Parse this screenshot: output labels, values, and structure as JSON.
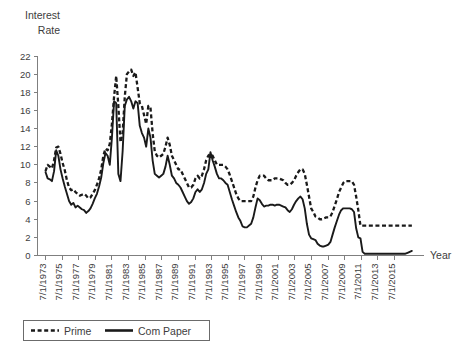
{
  "chart_data": {
    "type": "line",
    "title": "",
    "ylabel": "Interest\nRate",
    "ylabel_lines": [
      "Interest",
      "Rate"
    ],
    "xlabel": "Year",
    "ylim": [
      0,
      22
    ],
    "ytick_step": 2,
    "yticks": [
      0,
      2,
      4,
      6,
      8,
      10,
      12,
      14,
      16,
      18,
      20,
      22
    ],
    "grid": false,
    "legend_position": "bottom-left",
    "xtick_labels": [
      "7/1/1973",
      "7/1/1975",
      "7/1/1977",
      "7/1/1979",
      "7/1/1981",
      "7/1/1983",
      "7/1/1985",
      "7/1/1987",
      "7/1/1989",
      "7/1/1991",
      "7/1/1993",
      "7/1/1995",
      "7/1/1997",
      "7/1/1999",
      "7/1/2001",
      "7/1/2003",
      "7/1/2005",
      "7/1/2007",
      "7/1/2009",
      "7/1/2011",
      "7/1/2013",
      "7/1/2015"
    ],
    "x_start_year": 1973.5,
    "x_end_year": 2016.5,
    "x_step_years": 0.25,
    "series": [
      {
        "name": "Prime",
        "style": "dashed",
        "color": "#1a1a1a",
        "values": [
          9.3,
          10.0,
          9.8,
          9.6,
          10.5,
          11.9,
          12.0,
          11.2,
          10.2,
          9.4,
          8.3,
          7.5,
          7.2,
          7.3,
          7.0,
          6.8,
          6.6,
          6.7,
          6.8,
          6.6,
          6.3,
          6.4,
          6.8,
          7.2,
          7.8,
          8.5,
          9.5,
          11.0,
          11.8,
          11.6,
          12.3,
          14.5,
          17.5,
          19.8,
          16.5,
          12.5,
          13.5,
          17.5,
          20.0,
          20.3,
          20.5,
          19.8,
          20.2,
          18.5,
          16.8,
          16.5,
          15.5,
          14.5,
          16.5,
          16.3,
          13.5,
          11.5,
          11.0,
          10.8,
          11.0,
          11.2,
          12.0,
          13.0,
          12.2,
          11.0,
          10.5,
          10.0,
          9.5,
          9.5,
          9.0,
          8.5,
          8.0,
          7.5,
          7.5,
          7.8,
          8.5,
          8.8,
          8.5,
          8.8,
          9.5,
          10.5,
          11.0,
          11.2,
          11.0,
          10.5,
          10.0,
          10.0,
          10.0,
          10.0,
          9.8,
          9.5,
          8.9,
          8.2,
          7.5,
          6.8,
          6.3,
          6.0,
          6.0,
          6.0,
          6.0,
          6.0,
          6.0,
          6.5,
          7.5,
          8.3,
          8.8,
          8.8,
          8.8,
          8.5,
          8.3,
          8.3,
          8.3,
          8.5,
          8.5,
          8.5,
          8.4,
          8.3,
          8.0,
          7.8,
          7.8,
          8.0,
          8.3,
          8.8,
          9.2,
          9.5,
          9.5,
          9.0,
          7.8,
          6.5,
          5.2,
          4.8,
          4.3,
          4.2,
          4.0,
          4.0,
          4.1,
          4.2,
          4.2,
          4.3,
          4.8,
          5.5,
          6.2,
          7.0,
          7.5,
          8.0,
          8.2,
          8.2,
          8.2,
          8.2,
          7.8,
          6.5,
          5.0,
          3.3,
          3.3,
          3.3,
          3.3,
          3.3,
          3.3,
          3.3,
          3.3,
          3.3,
          3.3,
          3.3,
          3.3,
          3.3,
          3.3,
          3.3,
          3.3,
          3.3,
          3.3,
          3.3,
          3.3,
          3.3,
          3.3,
          3.3,
          3.3,
          3.3
        ]
      },
      {
        "name": "Com Paper",
        "style": "solid",
        "color": "#1a1a1a",
        "values": [
          9.2,
          8.5,
          8.4,
          8.2,
          9.3,
          11.6,
          11.0,
          9.5,
          8.5,
          7.6,
          6.8,
          6.0,
          5.6,
          5.8,
          5.3,
          5.5,
          5.3,
          5.1,
          5.0,
          4.7,
          4.9,
          5.2,
          5.7,
          6.3,
          6.8,
          7.6,
          8.6,
          10.2,
          11.3,
          11.0,
          10.0,
          13.0,
          17.0,
          16.8,
          9.0,
          8.2,
          11.5,
          16.5,
          17.2,
          17.5,
          17.0,
          16.2,
          17.0,
          16.8,
          14.3,
          13.5,
          13.0,
          12.0,
          14.0,
          13.0,
          10.5,
          9.0,
          8.8,
          8.6,
          8.8,
          9.0,
          9.8,
          11.0,
          10.0,
          8.8,
          8.5,
          8.0,
          7.8,
          7.5,
          7.0,
          6.5,
          6.0,
          5.7,
          5.9,
          6.3,
          7.0,
          7.3,
          7.0,
          7.3,
          8.0,
          9.0,
          9.5,
          11.4,
          10.5,
          9.8,
          9.0,
          8.5,
          8.5,
          8.3,
          8.0,
          7.8,
          7.0,
          6.2,
          5.5,
          4.8,
          4.2,
          3.8,
          3.2,
          3.1,
          3.1,
          3.3,
          3.5,
          4.2,
          5.3,
          6.3,
          6.1,
          5.7,
          5.4,
          5.5,
          5.5,
          5.6,
          5.6,
          5.5,
          5.6,
          5.6,
          5.5,
          5.4,
          5.3,
          5.0,
          4.8,
          5.1,
          5.6,
          6.0,
          6.3,
          6.5,
          6.2,
          5.2,
          3.5,
          2.3,
          1.9,
          1.8,
          1.7,
          1.3,
          1.1,
          1.0,
          1.0,
          1.1,
          1.2,
          1.5,
          2.3,
          3.1,
          3.8,
          4.5,
          5.0,
          5.2,
          5.2,
          5.2,
          5.2,
          5.1,
          4.8,
          3.0,
          2.0,
          1.9,
          0.4,
          0.2,
          0.2,
          0.2,
          0.2,
          0.2,
          0.2,
          0.2,
          0.2,
          0.2,
          0.2,
          0.2,
          0.2,
          0.2,
          0.2,
          0.2,
          0.2,
          0.2,
          0.2,
          0.2,
          0.2,
          0.3,
          0.4,
          0.5
        ]
      }
    ]
  },
  "legend": {
    "items": [
      {
        "label": "Prime",
        "style": "dashed"
      },
      {
        "label": "Com Paper",
        "style": "solid"
      }
    ]
  }
}
